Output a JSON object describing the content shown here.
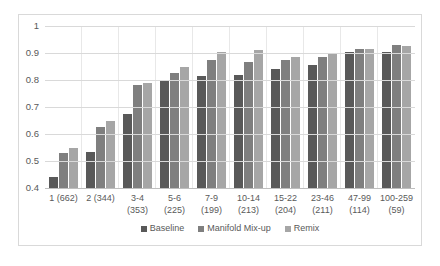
{
  "chart_data": {
    "type": "bar",
    "title": "",
    "subtitle": "",
    "xlabel": "",
    "ylabel": "",
    "ylim": [
      0.4,
      1.0
    ],
    "yticks": [
      "1",
      "0.9",
      "0.8",
      "0.7",
      "0.6",
      "0.5",
      "0.4"
    ],
    "ytick_values": [
      1.0,
      0.9,
      0.8,
      0.7,
      0.6,
      0.5,
      0.4
    ],
    "grid": true,
    "legend_position": "bottom",
    "categories": [
      "1 (662)",
      "2 (344)",
      "3-4\n(353)",
      "5-6\n(225)",
      "7-9\n(199)",
      "10-14\n(213)",
      "15-22\n(204)",
      "23-46\n(211)",
      "47-99\n(114)",
      "100-259\n(59)"
    ],
    "series": [
      {
        "name": "Baseline",
        "color": "#595959",
        "values": [
          0.44,
          0.535,
          0.675,
          0.795,
          0.815,
          0.82,
          0.84,
          0.855,
          0.905,
          0.905
        ]
      },
      {
        "name": "Manifold Mix-up",
        "color": "#7f7f7f",
        "values": [
          0.53,
          0.625,
          0.78,
          0.825,
          0.875,
          0.865,
          0.875,
          0.885,
          0.915,
          0.93
        ]
      },
      {
        "name": "Remix",
        "color": "#a6a6a6",
        "values": [
          0.55,
          0.65,
          0.79,
          0.85,
          0.905,
          0.91,
          0.885,
          0.895,
          0.915,
          0.925
        ]
      }
    ]
  }
}
